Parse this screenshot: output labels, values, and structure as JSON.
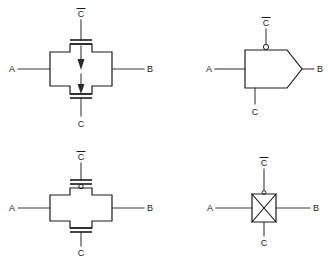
{
  "page": {
    "background_color": "#ffffff",
    "line_color": "#1a1a1a",
    "wire_color": "#3b3b3b",
    "width": 328,
    "height": 260
  },
  "labels": {
    "terminal_a": "A",
    "terminal_b": "B",
    "control_c": "C",
    "control_c_bar": "C"
  },
  "diagrams": [
    {
      "id": "diagram-top-left",
      "name": "transmission-gate-cross-with-arrows",
      "position": "top-left",
      "body_shape": "cross",
      "top_control": "C",
      "top_control_inverted": true,
      "bottom_control": "C",
      "bottom_control_inverted": false,
      "left_terminal": "A",
      "right_terminal": "B",
      "has_top_gate_bar": true,
      "has_bottom_gate_bar": true,
      "has_top_bubble": false,
      "has_arrows": true,
      "arrow_direction": "down"
    },
    {
      "id": "diagram-top-right",
      "name": "transmission-gate-pentagon-with-bubble",
      "position": "top-right",
      "body_shape": "pentagon",
      "top_control": "C",
      "top_control_inverted": true,
      "bottom_control": "C",
      "bottom_control_inverted": false,
      "left_terminal": "A",
      "right_terminal": "B",
      "has_top_gate_bar": false,
      "has_bottom_gate_bar": false,
      "has_top_bubble": true,
      "has_arrows": false
    },
    {
      "id": "diagram-bottom-left",
      "name": "transmission-gate-cross-with-bubble",
      "position": "bottom-left",
      "body_shape": "cross",
      "top_control": "C",
      "top_control_inverted": true,
      "bottom_control": "C",
      "bottom_control_inverted": false,
      "left_terminal": "A",
      "right_terminal": "B",
      "has_top_gate_bar": true,
      "has_bottom_gate_bar": true,
      "has_top_bubble": true,
      "has_arrows": false
    },
    {
      "id": "diagram-bottom-right",
      "name": "transmission-gate-bowtie",
      "position": "bottom-right",
      "body_shape": "bowtie",
      "top_control": "C",
      "top_control_inverted": true,
      "bottom_control": "C",
      "bottom_control_inverted": false,
      "left_terminal": "A",
      "right_terminal": "B",
      "has_top_gate_bar": false,
      "has_bottom_gate_bar": false,
      "has_top_bubble": true,
      "has_arrows": false
    }
  ]
}
